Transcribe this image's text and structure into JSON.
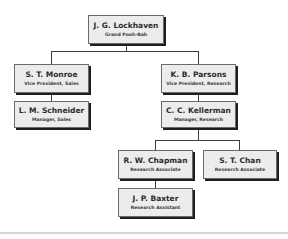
{
  "chart": {
    "type": "org-chart",
    "nodes": {
      "lockhaven": {
        "name": "J. G. Lockhaven",
        "title": "Grand Pooh-Bah"
      },
      "monroe": {
        "name": "S. T. Monroe",
        "title": "Vice President, Sales"
      },
      "schneider": {
        "name": "L. M. Schneider",
        "title": "Manager, Sales"
      },
      "parsons": {
        "name": "K. B. Parsons",
        "title": "Vice President, Research"
      },
      "kellerman": {
        "name": "C. C. Kellerman",
        "title": "Manager, Research"
      },
      "chapman": {
        "name": "R. W. Chapman",
        "title": "Research Associate"
      },
      "chan": {
        "name": "S. T. Chan",
        "title": "Research Associate"
      },
      "baxter": {
        "name": "J. P. Baxter",
        "title": "Research Assistant"
      }
    },
    "edges": [
      [
        "lockhaven",
        "monroe"
      ],
      [
        "lockhaven",
        "parsons"
      ],
      [
        "monroe",
        "schneider"
      ],
      [
        "parsons",
        "kellerman"
      ],
      [
        "kellerman",
        "chapman"
      ],
      [
        "kellerman",
        "chan"
      ],
      [
        "chapman",
        "baxter"
      ]
    ]
  },
  "colors": {
    "box_fill": "#ececec",
    "box_border": "#6a6a6a",
    "shadow": "#1e1e1e",
    "connector": "#3c3c3c",
    "text": "#2b2b2b"
  }
}
